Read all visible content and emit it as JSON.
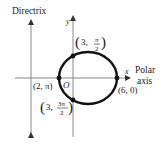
{
  "diagram": {
    "type": "polar-conic-ellipse",
    "labels": {
      "directrix": "Directrix",
      "y_axis": "y",
      "x_axis": "x",
      "polar": "Polar",
      "axis": "axis",
      "origin": "O"
    },
    "points": [
      {
        "name": "top",
        "r": "3",
        "theta": "π/2",
        "num": "π",
        "den": "2"
      },
      {
        "name": "left",
        "label": "(2, π)"
      },
      {
        "name": "right",
        "label": "(6, 0)"
      },
      {
        "name": "bottom",
        "r": "3",
        "theta": "3π/2",
        "num": "3π",
        "den": "2"
      }
    ],
    "colors": {
      "axis": "#888888",
      "curve": "#111111",
      "text": "#222222"
    }
  }
}
